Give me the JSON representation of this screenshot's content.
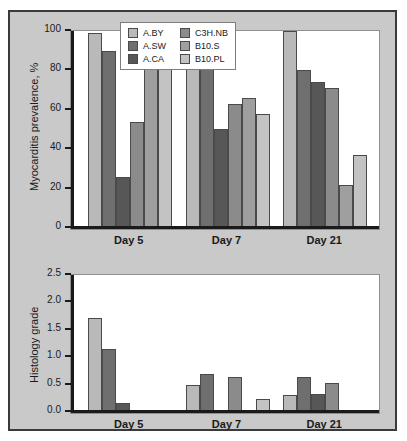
{
  "figure": {
    "panel_background": "#c9c9c9",
    "border_color": "#3a3a3a"
  },
  "series_colors": {
    "A.BY": "#b9b9b9",
    "A.SW": "#6f6f6f",
    "A.CA": "#575757",
    "C3H.NB": "#8b8b8b",
    "B10.S": "#9f9f9f",
    "B10.PL": "#c3c3c3"
  },
  "legend": {
    "entries": [
      {
        "label": "A.BY",
        "color": "#b9b9b9"
      },
      {
        "label": "C3H.NB",
        "color": "#8b8b8b"
      },
      {
        "label": "A.SW",
        "color": "#6f6f6f"
      },
      {
        "label": "B10.S",
        "color": "#9f9f9f"
      },
      {
        "label": "A.CA",
        "color": "#575757"
      },
      {
        "label": "B10.PL",
        "color": "#c3c3c3"
      }
    ]
  },
  "chart_data": [
    {
      "id": "myocarditis-prevalence",
      "type": "bar",
      "title": "",
      "xlabel": "",
      "ylabel": "Myocarditis prevalence, %",
      "ylim": [
        0,
        100
      ],
      "yticks": [
        0,
        20,
        40,
        60,
        80,
        100
      ],
      "ytick_labels": [
        "0",
        "20",
        "40",
        "60",
        "80",
        "100"
      ],
      "grid": false,
      "legend_position": "top-center",
      "categories": [
        "Day 5",
        "Day 7",
        "Day 21"
      ],
      "series": [
        {
          "name": "A.BY",
          "values": [
            98,
            98,
            99
          ]
        },
        {
          "name": "A.SW",
          "values": [
            89,
            98,
            79
          ]
        },
        {
          "name": "A.CA",
          "values": [
            25,
            49,
            73
          ]
        },
        {
          "name": "C3H.NB",
          "values": [
            53,
            62,
            70
          ]
        },
        {
          "name": "B10.S",
          "values": [
            89,
            65,
            21
          ]
        },
        {
          "name": "B10.PL",
          "values": [
            85,
            57,
            36
          ]
        }
      ]
    },
    {
      "id": "histology-grade",
      "type": "bar",
      "title": "",
      "xlabel": "",
      "ylabel": "Histology grade",
      "ylim": [
        0,
        2.5
      ],
      "yticks": [
        0.0,
        0.5,
        1.0,
        1.5,
        2.0,
        2.5
      ],
      "ytick_labels": [
        "0.0",
        "0.5",
        "1.0",
        "1.5",
        "2.0",
        "2.5"
      ],
      "grid": false,
      "legend_position": "none",
      "categories": [
        "Day 5",
        "Day 7",
        "Day 21"
      ],
      "series": [
        {
          "name": "A.BY",
          "values": [
            1.67,
            0.45,
            0.27
          ]
        },
        {
          "name": "A.SW",
          "values": [
            1.12,
            0.65,
            0.6
          ]
        },
        {
          "name": "A.CA",
          "values": [
            0.13,
            0.0,
            0.3
          ]
        },
        {
          "name": "C3H.NB",
          "values": [
            0.0,
            0.6,
            0.5
          ]
        },
        {
          "name": "B10.S",
          "values": [
            0.0,
            0.0,
            0.0
          ]
        },
        {
          "name": "B10.PL",
          "values": [
            0.0,
            0.2,
            0.0
          ]
        }
      ]
    }
  ]
}
